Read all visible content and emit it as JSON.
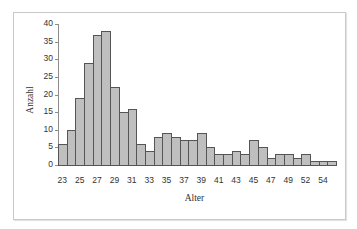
{
  "chart_data": {
    "type": "bar",
    "title": "",
    "xlabel": "Alter",
    "ylabel": "Anzahl",
    "ylim": [
      0,
      40
    ],
    "yticks": [
      0,
      5,
      10,
      15,
      20,
      25,
      30,
      35,
      40
    ],
    "categories": [
      "23",
      "24",
      "25",
      "26",
      "27",
      "28",
      "29",
      "30",
      "31",
      "32",
      "33",
      "34",
      "35",
      "36",
      "37",
      "38",
      "39",
      "40",
      "41",
      "42",
      "43",
      "44",
      "45",
      "46",
      "47",
      "48",
      "49",
      "50",
      "52",
      "53",
      "54",
      "55"
    ],
    "values": [
      6,
      10,
      19,
      29,
      37,
      38,
      22,
      15,
      16,
      6,
      4,
      8,
      9,
      8,
      7,
      7,
      9,
      5,
      3,
      3,
      4,
      3,
      7,
      5,
      2,
      3,
      3,
      2,
      3,
      1,
      1,
      1
    ],
    "xtick_labels": [
      "23",
      "25",
      "27",
      "29",
      "31",
      "33",
      "35",
      "37",
      "39",
      "41",
      "43",
      "45",
      "47",
      "49",
      "52",
      "54"
    ],
    "grid": false,
    "legend": null,
    "bar_color": "#bfbfbf",
    "bar_edge_color": "#555555"
  }
}
